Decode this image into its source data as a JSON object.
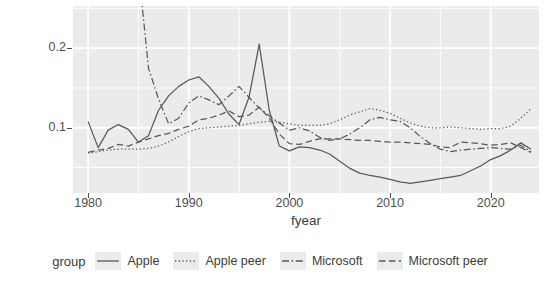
{
  "chart": {
    "type": "line",
    "title": "",
    "xlabel": "fyear",
    "ylabel": "rd_intensity3",
    "xlim": [
      1978.5,
      2024.8
    ],
    "ylim": [
      0.018,
      0.253
    ],
    "grid": true,
    "legend_position": "bottom",
    "legend_title": "group",
    "panel_background": "#ebebeb",
    "grid_color": "#ffffff",
    "line_color": "#595959",
    "xticks": [
      1980,
      1990,
      2000,
      2010,
      2020
    ],
    "xtick_labels": [
      "1980",
      "1990",
      "2000",
      "2010",
      "2020"
    ],
    "yticks": [
      0.1,
      0.2
    ],
    "ytick_labels": [
      "0.1",
      "0.2"
    ],
    "minor_x": [
      1985,
      1995,
      2005,
      2015
    ],
    "minor_y": [
      0.05,
      0.15,
      0.25
    ]
  },
  "chart_data": {
    "type": "line",
    "title": "",
    "xlabel": "fyear",
    "ylabel": "rd_intensity3",
    "xlim": [
      1978.5,
      2024.8
    ],
    "ylim": [
      0.018,
      0.253
    ],
    "grid": true,
    "legend_position": "bottom",
    "legend_title": "group",
    "x": [
      1980,
      1981,
      1982,
      1983,
      1984,
      1985,
      1986,
      1987,
      1988,
      1989,
      1990,
      1991,
      1992,
      1993,
      1994,
      1995,
      1996,
      1997,
      1998,
      1999,
      2000,
      2001,
      2002,
      2003,
      2004,
      2005,
      2006,
      2007,
      2008,
      2009,
      2010,
      2011,
      2012,
      2013,
      2014,
      2015,
      2016,
      2017,
      2018,
      2019,
      2020,
      2021,
      2022,
      2023,
      2024
    ],
    "series": [
      {
        "name": "Apple",
        "linetype": "solid",
        "values": [
          0.108,
          0.075,
          0.097,
          0.104,
          0.098,
          0.082,
          0.09,
          0.122,
          0.14,
          0.152,
          0.16,
          0.164,
          0.152,
          0.137,
          0.117,
          0.104,
          0.139,
          0.205,
          0.122,
          0.077,
          0.071,
          0.076,
          0.075,
          0.072,
          0.067,
          0.058,
          0.049,
          0.043,
          0.04,
          0.038,
          0.035,
          0.032,
          0.03,
          0.032,
          0.034,
          0.036,
          0.038,
          0.04,
          0.046,
          0.052,
          0.06,
          0.065,
          0.072,
          0.081,
          0.073
        ]
      },
      {
        "name": "Apple peer",
        "linetype": "dotted",
        "values": [
          0.068,
          0.07,
          0.072,
          0.073,
          0.073,
          0.073,
          0.074,
          0.077,
          0.082,
          0.089,
          0.095,
          0.099,
          0.1,
          0.101,
          0.102,
          0.103,
          0.105,
          0.107,
          0.108,
          0.107,
          0.105,
          0.103,
          0.103,
          0.103,
          0.105,
          0.11,
          0.116,
          0.12,
          0.124,
          0.122,
          0.118,
          0.112,
          0.106,
          0.102,
          0.1,
          0.1,
          0.101,
          0.1,
          0.099,
          0.098,
          0.099,
          0.099,
          0.102,
          0.112,
          0.124
        ]
      },
      {
        "name": "Microsoft",
        "linetype": "dashdot",
        "values": [
          null,
          null,
          null,
          null,
          null,
          0.3,
          0.175,
          0.136,
          0.105,
          0.112,
          0.131,
          0.14,
          0.135,
          0.129,
          0.14,
          0.152,
          0.138,
          0.125,
          0.115,
          0.106,
          0.097,
          0.1,
          0.096,
          0.088,
          0.084,
          0.086,
          0.092,
          0.1,
          0.11,
          0.113,
          0.11,
          0.108,
          0.1,
          0.089,
          0.08,
          0.073,
          0.07,
          0.072,
          0.073,
          0.074,
          0.075,
          0.074,
          0.073,
          0.078,
          0.07
        ]
      },
      {
        "name": "Microsoft peer",
        "linetype": "dashed",
        "values": [
          0.069,
          0.072,
          0.074,
          0.079,
          0.077,
          0.082,
          0.086,
          0.09,
          0.093,
          0.098,
          0.102,
          0.11,
          0.112,
          0.116,
          0.121,
          0.114,
          0.116,
          0.126,
          0.112,
          0.092,
          0.08,
          0.079,
          0.083,
          0.086,
          0.086,
          0.086,
          0.085,
          0.084,
          0.084,
          0.083,
          0.082,
          0.082,
          0.081,
          0.08,
          0.079,
          0.076,
          0.075,
          0.082,
          0.081,
          0.08,
          0.078,
          0.079,
          0.081,
          0.075,
          0.069
        ]
      }
    ]
  },
  "legend": {
    "title": "group",
    "items": [
      {
        "label": "Apple",
        "key": "legend-key-apple"
      },
      {
        "label": "Apple peer",
        "key": "legend-key-apple-peer"
      },
      {
        "label": "Microsoft",
        "key": "legend-key-microsoft"
      },
      {
        "label": "Microsoft peer",
        "key": "legend-key-microsoft-peer"
      }
    ]
  }
}
